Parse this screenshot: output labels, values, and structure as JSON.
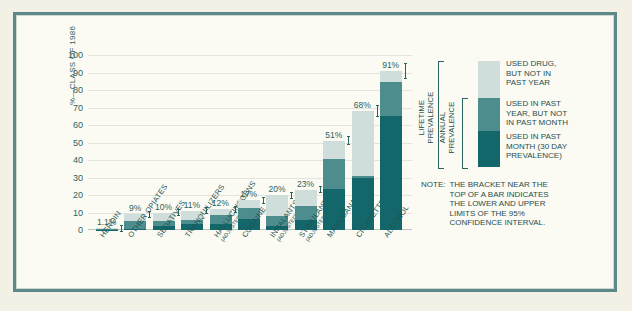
{
  "chart_data": {
    "type": "bar",
    "title": "",
    "xlabel": "",
    "ylabel": "%—CLASS OF 1986",
    "ylim": [
      0,
      100
    ],
    "yticks": [
      0,
      10,
      20,
      30,
      40,
      50,
      60,
      70,
      80,
      90,
      100
    ],
    "grid": true,
    "stacked": true,
    "legend_position": "right",
    "categories": [
      "HEROIN",
      "OTHER OPIATES",
      "SEDATIVES",
      "TRANQUILIZERS",
      "HALLUCINOGENS",
      "COCAINE",
      "INHALANTS",
      "STIMULANTS",
      "MARIJUANA",
      "CIGARETTES",
      "ALCOHOL"
    ],
    "category_sublabels": [
      "",
      "",
      "",
      "",
      "(ADJUSTED)",
      "",
      "(ADJUSTED)",
      "(ADJUSTED)",
      "",
      "",
      ""
    ],
    "data_labels": [
      "1.1%",
      "9%",
      "10%",
      "11%",
      "12%",
      "17%",
      "20%",
      "23%",
      "51%",
      "68%",
      "91%"
    ],
    "series": [
      {
        "name": "USED IN PAST MONTH (30 DAY PREVALENCE)",
        "color": "#13676a",
        "values": [
          0.2,
          0.6,
          2.2,
          3.5,
          3.5,
          6.2,
          2.5,
          5.5,
          23.4,
          29.6,
          65.3
        ]
      },
      {
        "name": "USED IN PAST YEAR, BUT NOT IN PAST MONTH",
        "color": "#4e8d8d",
        "values": [
          0.3,
          4.4,
          3.1,
          2.5,
          5.0,
          6.3,
          5.5,
          8.0,
          17.3,
          1.4,
          19.3
        ]
      },
      {
        "name": "USED DRUG, BUT NOT IN PAST YEAR",
        "color": "#cfdedb",
        "values": [
          0.6,
          4.0,
          4.7,
          5.0,
          3.5,
          4.5,
          12.0,
          9.5,
          10.3,
          37.0,
          6.4
        ]
      }
    ],
    "confidence_bracket_note": "bracket near top of bar = 95% confidence interval"
  },
  "legend": {
    "items": [
      {
        "label": "USED DRUG,\nBUT NOT IN\nPAST YEAR",
        "color": "#cfdedb"
      },
      {
        "label": "USED IN PAST\nYEAR, BUT NOT\nIN PAST MONTH",
        "color": "#4e8d8d"
      },
      {
        "label": "USED IN PAST\nMONTH (30 DAY\nPREVALENCE)",
        "color": "#13676a"
      }
    ],
    "brackets": [
      {
        "label": "LIFETIME\nPREVALENCE"
      },
      {
        "label": "ANNUAL\nPREVALENCE"
      }
    ]
  },
  "note": {
    "key": "NOTE:",
    "body": "THE BRACKET NEAR THE\nTOP OF A BAR INDICATES\nTHE LOWER AND UPPER\nLIMITS OF THE 95%\nCONFIDENCE INTERVAL."
  },
  "colors": {
    "accent": "#13676a",
    "mid": "#4e8d8d",
    "light": "#cfdedb",
    "frame": "#5d8a88",
    "paper": "#fbfaf3",
    "page": "#f3f1e6"
  }
}
